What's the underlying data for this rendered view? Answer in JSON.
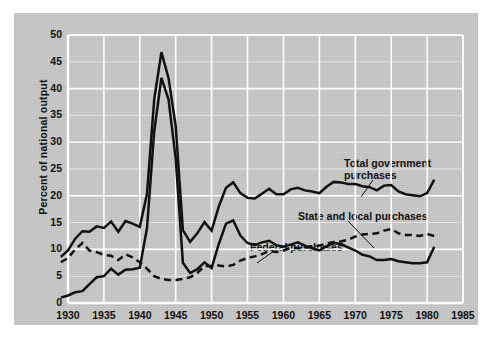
{
  "figure": {
    "panel_color": "#c9c9c9",
    "grid_color": "#ffffff",
    "line_color": "#111111",
    "axis_color": "#ffffff"
  },
  "chart_data": {
    "type": "line",
    "title": "",
    "xlabel": "",
    "ylabel": "Percent of national output",
    "xlim": [
      1930,
      1985
    ],
    "ylim": [
      0,
      50
    ],
    "grid": true,
    "legend": "annotations",
    "xticks": [
      1930,
      1935,
      1940,
      1945,
      1950,
      1955,
      1960,
      1965,
      1970,
      1975,
      1980,
      1985
    ],
    "yticks": [
      0,
      5,
      10,
      15,
      20,
      25,
      30,
      35,
      40,
      45,
      50
    ],
    "x": [
      1929,
      1930,
      1931,
      1932,
      1933,
      1934,
      1935,
      1936,
      1937,
      1938,
      1939,
      1940,
      1941,
      1942,
      1943,
      1944,
      1945,
      1946,
      1947,
      1948,
      1949,
      1950,
      1951,
      1952,
      1953,
      1954,
      1955,
      1956,
      1957,
      1958,
      1959,
      1960,
      1961,
      1962,
      1963,
      1964,
      1965,
      1966,
      1967,
      1968,
      1969,
      1970,
      1971,
      1972,
      1973,
      1974,
      1975,
      1976,
      1977,
      1978,
      1979,
      1980,
      1981
    ],
    "series": [
      {
        "name": "Total government purchases",
        "style": "solid",
        "values": [
          8.6,
          9.8,
          12.0,
          13.4,
          13.3,
          14.3,
          14.0,
          15.2,
          13.3,
          15.3,
          14.8,
          14.2,
          20.4,
          38.0,
          46.8,
          42.0,
          33.0,
          13.6,
          11.4,
          13.0,
          15.1,
          13.5,
          18.0,
          21.5,
          22.5,
          20.5,
          19.6,
          19.5,
          20.4,
          21.3,
          20.3,
          20.3,
          21.2,
          21.5,
          21.0,
          20.8,
          20.5,
          21.7,
          22.6,
          22.5,
          22.2,
          22.2,
          21.8,
          21.6,
          21.0,
          21.9,
          22.0,
          20.8,
          20.3,
          20.1,
          19.9,
          20.5,
          23.0
        ]
      },
      {
        "name": "Federal purchases",
        "style": "solid",
        "values": [
          1.0,
          1.4,
          2.0,
          2.2,
          3.5,
          4.8,
          5.0,
          6.4,
          5.3,
          6.2,
          6.3,
          6.6,
          14.0,
          32.0,
          42.0,
          38.0,
          27.0,
          7.5,
          5.6,
          6.3,
          7.6,
          6.5,
          11.0,
          14.8,
          15.4,
          12.6,
          11.2,
          10.8,
          11.3,
          11.6,
          10.8,
          10.5,
          10.9,
          11.3,
          10.7,
          10.2,
          9.8,
          10.6,
          11.2,
          11.0,
          10.4,
          9.8,
          9.0,
          8.7,
          8.0,
          8.0,
          8.2,
          7.8,
          7.6,
          7.4,
          7.4,
          7.6,
          10.5
        ]
      },
      {
        "name": "State and local purchases",
        "style": "dashed",
        "values": [
          7.6,
          8.4,
          10.0,
          11.2,
          9.8,
          9.5,
          9.0,
          8.8,
          8.0,
          9.1,
          8.5,
          7.6,
          6.4,
          5.0,
          4.5,
          4.3,
          4.3,
          4.5,
          4.8,
          5.6,
          6.9,
          6.9,
          7.0,
          6.8,
          7.1,
          7.9,
          8.4,
          8.7,
          9.1,
          9.7,
          9.5,
          9.8,
          10.3,
          10.2,
          10.3,
          10.6,
          10.7,
          11.1,
          11.4,
          11.5,
          11.8,
          12.4,
          12.8,
          12.9,
          13.0,
          13.5,
          13.8,
          13.0,
          12.7,
          12.7,
          12.5,
          12.9,
          12.5
        ]
      }
    ],
    "annotations": [
      {
        "id": "total-government-purchases",
        "text": "Total government\npurchases",
        "x_px": 330,
        "y_px": 144,
        "leader": {
          "x1": 359,
          "y1": 167,
          "x2": 347,
          "y2": 184
        }
      },
      {
        "id": "state-and-local-purchases",
        "text": "State and local purchases",
        "x_px": 284,
        "y_px": 197,
        "leader": {
          "x1": 334,
          "y1": 208,
          "x2": 360,
          "y2": 235
        }
      },
      {
        "id": "federal-purchases",
        "text": "Federal purchases",
        "x_px": 236,
        "y_px": 228,
        "leader": {
          "x1": 260,
          "y1": 238,
          "x2": 243,
          "y2": 250
        }
      }
    ]
  }
}
